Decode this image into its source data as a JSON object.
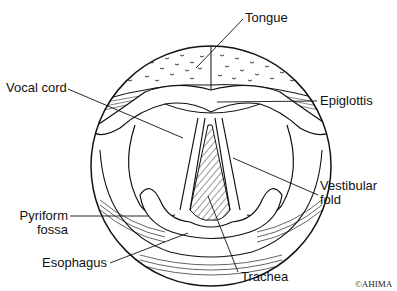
{
  "diagram": {
    "colors": {
      "line": "#111111",
      "background": "#ffffff",
      "hatch": "#333333"
    },
    "labels": [
      {
        "id": "tongue",
        "text": "Tongue"
      },
      {
        "id": "vocal-cord",
        "text": "Vocal cord"
      },
      {
        "id": "epiglottis",
        "text": "Epiglottis"
      },
      {
        "id": "vestibular-fold",
        "line1": "Vestibular",
        "line2": "fold"
      },
      {
        "id": "pyriform-fossa",
        "line1": "Pyriform",
        "line2": "fossa"
      },
      {
        "id": "esophagus",
        "text": "Esophagus"
      },
      {
        "id": "trachea",
        "text": "Trachea"
      }
    ],
    "copyright": "©AHIMA"
  }
}
